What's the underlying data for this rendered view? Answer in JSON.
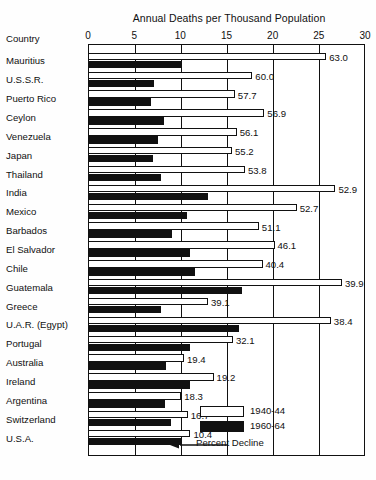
{
  "chart_data": {
    "type": "bar",
    "title": "Annual Deaths per Thousand Population",
    "xlabel": "",
    "ylabel": "Country",
    "xlim": [
      0,
      30
    ],
    "xticks": [
      0,
      5,
      10,
      15,
      20,
      25,
      30
    ],
    "grid": true,
    "orientation": "horizontal",
    "legend_position": "inside-bottom-right",
    "legend": [
      {
        "name": "1940-44",
        "color": "#ffffff"
      },
      {
        "name": "1960-64",
        "color": "#111111"
      }
    ],
    "annotation": "Percent Decline",
    "categories": [
      "Mauritius",
      "U.S.S.R.",
      "Puerto Rico",
      "Ceylon",
      "Venezuela",
      "Japan",
      "Thailand",
      "India",
      "Mexico",
      "Barbados",
      "El Salvador",
      "Chile",
      "Guatemala",
      "Greece",
      "U.A.R. (Egypt)",
      "Portugal",
      "Australia",
      "Ireland",
      "Argentina",
      "Switzerland",
      "U.S.A."
    ],
    "series": [
      {
        "name": "1940-44",
        "color": "#ffffff",
        "values": [
          25.8,
          17.8,
          15.9,
          19.1,
          16.1,
          15.6,
          17.0,
          26.8,
          22.6,
          18.5,
          20.2,
          18.9,
          27.5,
          13.0,
          26.3,
          15.7,
          10.4,
          13.6,
          10.1,
          10.8,
          11.1
        ]
      },
      {
        "name": "1960-64",
        "color": "#111111",
        "values": [
          10.2,
          7.2,
          6.8,
          8.2,
          7.6,
          7.0,
          7.9,
          13.0,
          10.7,
          9.1,
          11.0,
          11.6,
          16.7,
          7.9,
          16.3,
          11.1,
          8.4,
          11.0,
          8.3,
          9.0,
          10.2
        ]
      }
    ],
    "data_labels": [
      "63.0",
      "60.0",
      "57.7",
      "56.9",
      "56.1",
      "55.2",
      "53.8",
      "52.9",
      "52.7",
      "51.1",
      "46.1",
      "40.4",
      "39.9",
      "39.1",
      "38.4",
      "32.1",
      "19.4",
      "19.2",
      "18.3",
      "16.7",
      "10.4"
    ]
  }
}
